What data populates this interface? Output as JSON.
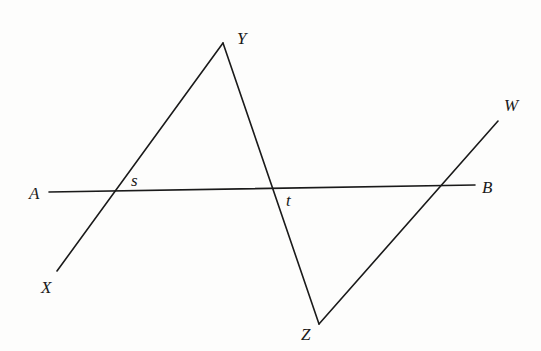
{
  "diagram": {
    "points": {
      "Y": {
        "label": "Y",
        "x": 223,
        "y": 43,
        "label_x": 237,
        "label_y": 44
      },
      "X": {
        "label": "X",
        "x": 57,
        "y": 271,
        "label_x": 41,
        "label_y": 293
      },
      "Z": {
        "label": "Z",
        "x": 319,
        "y": 324,
        "label_x": 301,
        "label_y": 340
      },
      "W": {
        "label": "W",
        "x": 498,
        "y": 121,
        "label_x": 504,
        "label_y": 111
      },
      "A": {
        "label": "A",
        "x": 49,
        "y": 192,
        "label_x": 29,
        "label_y": 199
      },
      "B": {
        "label": "B",
        "x": 475,
        "y": 185,
        "label_x": 482,
        "label_y": 193
      },
      "s": {
        "label": "s",
        "x": 112,
        "y": 191,
        "label_x": 131,
        "label_y": 186
      },
      "t": {
        "label": "t",
        "x": 273,
        "y": 189,
        "label_x": 286,
        "label_y": 206
      }
    },
    "segments": [
      {
        "name": "AB",
        "from": "A",
        "to": "B"
      },
      {
        "name": "XY",
        "from": "X",
        "to": "Y"
      },
      {
        "name": "YZ",
        "from": "Y",
        "to": "Z"
      },
      {
        "name": "ZW",
        "from": "Z",
        "to": "W"
      }
    ],
    "labels": [
      "Y",
      "W",
      "A",
      "s",
      "t",
      "B",
      "X",
      "Z"
    ],
    "colors": {
      "line": "#1a1a1a",
      "background": "#fdfdfc"
    }
  }
}
